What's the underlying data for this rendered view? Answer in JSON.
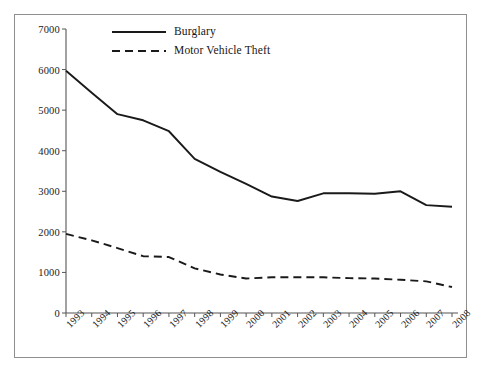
{
  "chart_data": {
    "type": "line",
    "title": "",
    "subtitle": "",
    "xlabel": "",
    "ylabel": "",
    "x": [
      1993,
      1994,
      1995,
      1996,
      1997,
      1998,
      1999,
      2000,
      2001,
      2002,
      2003,
      2004,
      2005,
      2006,
      2007,
      2008
    ],
    "categories": [
      "1993",
      "1994",
      "1995",
      "1996",
      "1997",
      "1998",
      "1999",
      "2000",
      "2001",
      "2002",
      "2003",
      "2004",
      "2005",
      "2006",
      "2007",
      "2008"
    ],
    "series": [
      {
        "name": "Burglary",
        "style": "solid",
        "color": "#1a1a1a",
        "values": [
          5970,
          5430,
          4900,
          4750,
          4480,
          3800,
          3480,
          3180,
          2870,
          2760,
          2950,
          2950,
          2940,
          3000,
          2660,
          2620
        ]
      },
      {
        "name": "Motor Vehicle Theft",
        "style": "dashed",
        "color": "#1a1a1a",
        "values": [
          1950,
          1790,
          1600,
          1400,
          1380,
          1100,
          950,
          850,
          880,
          880,
          880,
          860,
          850,
          820,
          780,
          640
        ]
      }
    ],
    "ylim": [
      0,
      7000
    ],
    "yticks": [
      0,
      1000,
      2000,
      3000,
      4000,
      5000,
      6000,
      7000
    ],
    "ytick_labels": [
      "0",
      "1000",
      "2000",
      "3000",
      "4000",
      "5000",
      "6000",
      "7000"
    ],
    "xtick_labels": [
      "1993",
      "1994",
      "1995",
      "1996",
      "1997",
      "1998",
      "1999",
      "2000",
      "2001",
      "2002",
      "2003",
      "2004",
      "2005",
      "2006",
      "2007",
      "2008"
    ],
    "xtick_rotation": -45,
    "grid": false,
    "legend_position": "top-left-inside",
    "legend": [
      {
        "label": "Burglary",
        "style": "solid"
      },
      {
        "label": "Motor Vehicle Theft",
        "style": "dashed"
      }
    ],
    "axis_color": "#555555",
    "frame_color": "#8e8e8e",
    "background": "#ffffff"
  }
}
